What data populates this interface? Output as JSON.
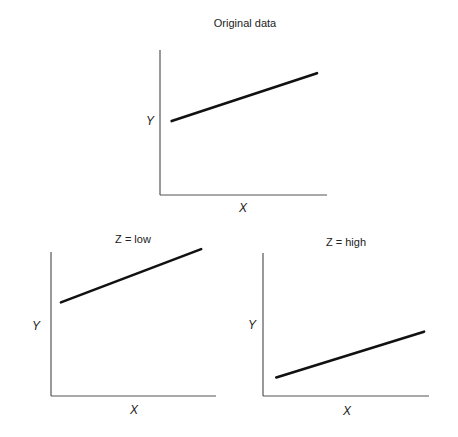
{
  "chart_data": [
    {
      "type": "line",
      "title": "Original data",
      "xlabel": "X",
      "ylabel": "Y",
      "xlim": [
        0,
        1
      ],
      "ylim": [
        0,
        1
      ],
      "grid": false,
      "series": [
        {
          "name": "original",
          "x": [
            0.07,
            0.94
          ],
          "y": [
            0.51,
            0.84
          ]
        }
      ]
    },
    {
      "type": "line",
      "title": "Z = low",
      "xlabel": "X",
      "ylabel": "Y",
      "xlim": [
        0,
        1
      ],
      "ylim": [
        0,
        1
      ],
      "grid": false,
      "series": [
        {
          "name": "z-low",
          "x": [
            0.06,
            0.91
          ],
          "y": [
            0.65,
            1.02
          ]
        }
      ]
    },
    {
      "type": "line",
      "title": "Z = high",
      "xlabel": "X",
      "ylabel": "Y",
      "xlim": [
        0,
        1
      ],
      "ylim": [
        0,
        1
      ],
      "grid": false,
      "series": [
        {
          "name": "z-high",
          "x": [
            0.08,
            0.97
          ],
          "y": [
            0.13,
            0.45
          ]
        }
      ]
    }
  ]
}
